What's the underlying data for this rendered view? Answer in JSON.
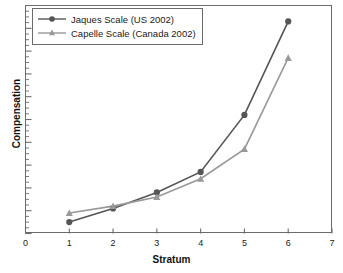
{
  "chart_data": {
    "type": "line",
    "title": "",
    "xlabel": "Stratum",
    "ylabel": "Compensation",
    "x": [
      1,
      2,
      3,
      4,
      5,
      6
    ],
    "xlim": [
      0,
      7
    ],
    "ylim": [
      0,
      100
    ],
    "xticks": [
      "0",
      "1",
      "2",
      "3",
      "4",
      "5",
      "6",
      "7"
    ],
    "yticks": [],
    "grid": false,
    "legend_position": "top-left",
    "series": [
      {
        "name": "Jaques Scale (US 2002)",
        "marker": "circle",
        "color": "#555555",
        "values": [
          5,
          11,
          18,
          27,
          52,
          93
        ]
      },
      {
        "name": "Capelle Scale (Canada 2002)",
        "marker": "triangle",
        "color": "#999999",
        "values": [
          9,
          12,
          16,
          24,
          37,
          77
        ]
      }
    ]
  },
  "axis": {
    "x_title": "Stratum",
    "y_title": "Compensation",
    "x_tick_labels": [
      "0",
      "1",
      "2",
      "3",
      "4",
      "5",
      "6",
      "7"
    ]
  },
  "legend": {
    "entries": [
      {
        "label": "Jaques Scale (US 2002)",
        "marker": "circle",
        "color": "#555555"
      },
      {
        "label": "Capelle Scale (Canada 2002)",
        "marker": "triangle",
        "color": "#999999"
      }
    ]
  },
  "colors": {
    "series_primary": "#555555",
    "series_secondary": "#999999",
    "frame": "#6b6b6b",
    "text": "#1a1a1a",
    "background": "#ffffff"
  }
}
